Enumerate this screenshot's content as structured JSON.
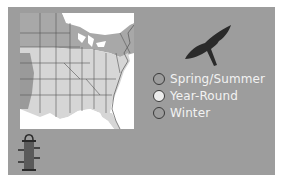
{
  "range_map": {
    "region": "Eastern United States",
    "colors": {
      "panel_bg": "#9d9d9d",
      "spring_summer": "#9d9d9d",
      "year_round": "#d9d9d9",
      "winter": "#9d9d9d",
      "outside": "#ffffff"
    }
  },
  "legend": {
    "items": [
      {
        "label": "Spring/Summer",
        "swatch": "#9d9d9d"
      },
      {
        "label": "Year-Round",
        "swatch": "#ececec"
      },
      {
        "label": "Winter",
        "swatch": "#9d9d9d"
      }
    ]
  },
  "icons": {
    "bird": "hawk-silhouette-icon",
    "feeder": "bird-feeder-icon"
  }
}
